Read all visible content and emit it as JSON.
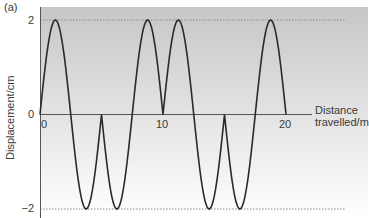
{
  "panel_label": "(a)",
  "colors": {
    "background_top": "#c6c6c6",
    "background_bottom": "#ffffff",
    "curve": "#2a2a2a",
    "axis": "#555555",
    "dashed": "#8a8a8a"
  },
  "chart_data": {
    "type": "line",
    "title": "",
    "xlabel": "Distance travelled/m",
    "xlabel_line1": "Distance",
    "xlabel_line2": "travelled/m",
    "ylabel": "Displacement/cm",
    "xlim": [
      0,
      20
    ],
    "ylim": [
      -2,
      2
    ],
    "x_ticks": [
      0,
      10,
      20
    ],
    "x_tick_labels": [
      "0",
      "10",
      "20"
    ],
    "y_ticks": [
      2,
      0,
      -2
    ],
    "y_tick_labels": [
      "2",
      "0",
      "−2"
    ],
    "grid": false,
    "reference_lines": [
      {
        "y": 2,
        "style": "dotted"
      },
      {
        "y": -2,
        "style": "dotted"
      }
    ],
    "segments": [
      {
        "x_start": 0,
        "x_end": 2.5,
        "sign": 1
      },
      {
        "x_start": 2.5,
        "x_end": 5,
        "sign": -1
      },
      {
        "x_start": 5,
        "x_end": 7.5,
        "sign": -1
      },
      {
        "x_start": 7.5,
        "x_end": 10,
        "sign": 1
      },
      {
        "x_start": 10,
        "x_end": 12.5,
        "sign": 1
      },
      {
        "x_start": 12.5,
        "x_end": 15,
        "sign": -1
      },
      {
        "x_start": 15,
        "x_end": 17.5,
        "sign": -1
      },
      {
        "x_start": 17.5,
        "x_end": 20,
        "sign": 1
      }
    ],
    "amplitude": 2,
    "key_points": [
      {
        "x": 0,
        "y": 0
      },
      {
        "x": 1.25,
        "y": 2
      },
      {
        "x": 2.5,
        "y": 0
      },
      {
        "x": 3.75,
        "y": -2
      },
      {
        "x": 5,
        "y": 0
      },
      {
        "x": 6.25,
        "y": -2
      },
      {
        "x": 7.5,
        "y": 0
      },
      {
        "x": 8.75,
        "y": 2
      },
      {
        "x": 10,
        "y": 0
      },
      {
        "x": 11.25,
        "y": 2
      },
      {
        "x": 12.5,
        "y": 0
      },
      {
        "x": 13.75,
        "y": -2
      },
      {
        "x": 15,
        "y": 0
      },
      {
        "x": 16.25,
        "y": -2
      },
      {
        "x": 17.5,
        "y": 0
      },
      {
        "x": 18.75,
        "y": 2
      },
      {
        "x": 20,
        "y": 0
      }
    ]
  }
}
